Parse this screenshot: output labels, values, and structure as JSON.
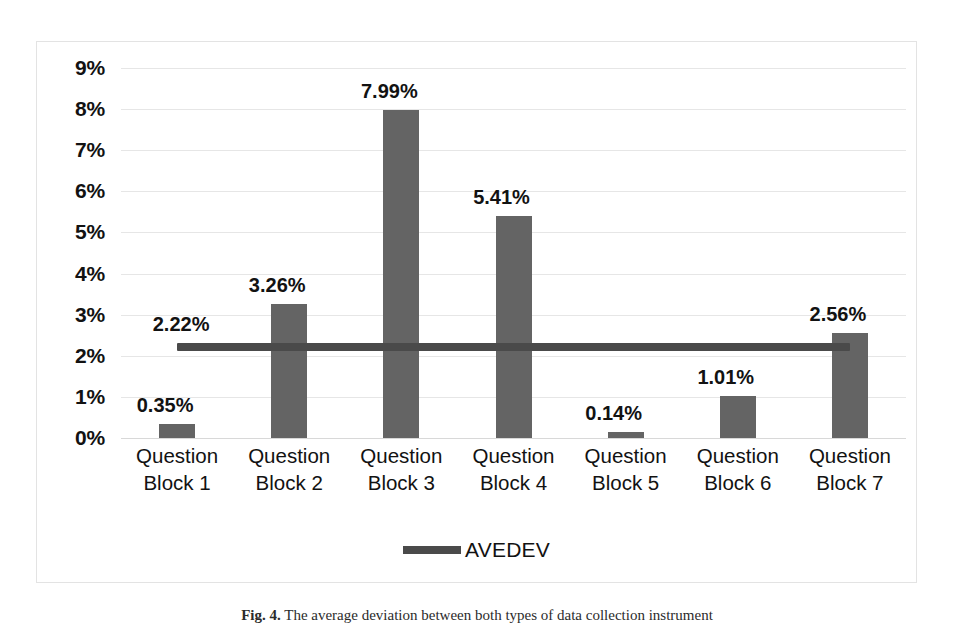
{
  "chart_data": {
    "type": "bar",
    "title": "",
    "xlabel": "",
    "ylabel": "",
    "ylim": [
      0,
      9
    ],
    "ytick_values": [
      9,
      8,
      7,
      6,
      5,
      4,
      3,
      2,
      1,
      0
    ],
    "ytick_labels": [
      "9%",
      "8%",
      "7%",
      "6%",
      "5%",
      "4%",
      "3%",
      "2%",
      "1%",
      "0%"
    ],
    "grid": true,
    "legend_position": "bottom",
    "categories": [
      "Question Block 1",
      "Question Block 2",
      "Question Block 3",
      "Question Block 4",
      "Question Block 5",
      "Question Block 6",
      "Question Block 7"
    ],
    "category_lines": [
      [
        "Question",
        "Block 1"
      ],
      [
        "Question",
        "Block 2"
      ],
      [
        "Question",
        "Block 3"
      ],
      [
        "Question",
        "Block 4"
      ],
      [
        "Question",
        "Block 5"
      ],
      [
        "Question",
        "Block 6"
      ],
      [
        "Question",
        "Block 7"
      ]
    ],
    "values": [
      0.35,
      3.26,
      7.99,
      5.41,
      0.14,
      1.01,
      2.56
    ],
    "value_labels": [
      "0.35%",
      "3.26%",
      "7.99%",
      "5.41%",
      "0.14%",
      "1.01%",
      "2.56%"
    ],
    "series": [
      {
        "name": "Bars",
        "type": "bar",
        "color": "#646464",
        "values": [
          0.35,
          3.26,
          7.99,
          5.41,
          0.14,
          1.01,
          2.56
        ]
      },
      {
        "name": "AVEDEV",
        "type": "line",
        "color": "#4a4a4a",
        "constant_value": 2.22,
        "value_label": "2.22%",
        "values": [
          2.22,
          2.22,
          2.22,
          2.22,
          2.22,
          2.22,
          2.22
        ]
      }
    ],
    "legend": [
      {
        "label": "AVEDEV",
        "color": "#4a4a4a",
        "marker": "line"
      }
    ]
  },
  "colors": {
    "bar": "#646464",
    "line": "#4a4a4a",
    "grid": "#e6e6e6",
    "frame": "#e3e3e3",
    "text": "#121212",
    "background": "#ffffff"
  },
  "caption": {
    "label": "Fig. 4.",
    "text": "The average deviation between both types of data collection instrument"
  }
}
